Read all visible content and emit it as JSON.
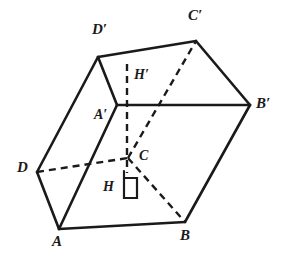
{
  "figure": {
    "stroke_color": "#1a1a1a",
    "background_color": "#ffffff",
    "solid_stroke_width": 2.6,
    "dashed_stroke_width": 2.4,
    "dash_pattern": "7,5",
    "width": 286,
    "height": 262
  },
  "labels": [
    {
      "id": "d-prime",
      "text": "D′",
      "x": 92,
      "y": 22
    },
    {
      "id": "c-prime",
      "text": "C′",
      "x": 188,
      "y": 8
    },
    {
      "id": "h-prime",
      "text": "H′",
      "x": 134,
      "y": 68
    },
    {
      "id": "b-prime",
      "text": "B′",
      "x": 256,
      "y": 96
    },
    {
      "id": "a-prime",
      "text": "A′",
      "x": 94,
      "y": 108
    },
    {
      "id": "d",
      "text": "D",
      "x": 17,
      "y": 160
    },
    {
      "id": "c",
      "text": "C",
      "x": 139,
      "y": 149
    },
    {
      "id": "h",
      "text": "H",
      "x": 103,
      "y": 180
    },
    {
      "id": "a",
      "text": "A",
      "x": 52,
      "y": 234
    },
    {
      "id": "b",
      "text": "B",
      "x": 180,
      "y": 228
    }
  ],
  "vertices": {
    "A": {
      "x": 59,
      "y": 229
    },
    "B": {
      "x": 185,
      "y": 222
    },
    "C": {
      "x": 128,
      "y": 158
    },
    "D": {
      "x": 37,
      "y": 172
    },
    "Ap": {
      "x": 117,
      "y": 105
    },
    "Bp": {
      "x": 250,
      "y": 105
    },
    "Cp": {
      "x": 196,
      "y": 41
    },
    "Dp": {
      "x": 98,
      "y": 57
    },
    "H": {
      "x": 127,
      "y": 173
    },
    "Hp": {
      "x": 127,
      "y": 64
    }
  },
  "edges": {
    "solid": [
      {
        "id": "edge-A-B",
        "from": "A",
        "to": "B"
      },
      {
        "id": "edge-A-D",
        "from": "A",
        "to": "D"
      },
      {
        "id": "edge-A-Ap",
        "from": "A",
        "to": "Ap"
      },
      {
        "id": "edge-B-Bp",
        "from": "B",
        "to": "Bp"
      },
      {
        "id": "edge-D-Dp",
        "from": "D",
        "to": "Dp"
      },
      {
        "id": "edge-Ap-Bp",
        "from": "Ap",
        "to": "Bp"
      },
      {
        "id": "edge-Ap-Dp",
        "from": "Ap",
        "to": "Dp"
      },
      {
        "id": "edge-Dp-Cp",
        "from": "Dp",
        "to": "Cp"
      },
      {
        "id": "edge-Cp-Bp",
        "from": "Cp",
        "to": "Bp"
      }
    ],
    "dashed": [
      {
        "id": "edge-D-C",
        "from": "D",
        "to": "C"
      },
      {
        "id": "edge-C-B",
        "from": "C",
        "to": "B"
      },
      {
        "id": "edge-C-Cp",
        "from": "C",
        "to": "Cp"
      },
      {
        "id": "edge-Hp-H",
        "from": "Hp",
        "to": "H"
      }
    ]
  },
  "right_angle_mark": {
    "id": "right-angle-at-H",
    "points": "124,171 124,198 137,198 137,178 124,178"
  }
}
